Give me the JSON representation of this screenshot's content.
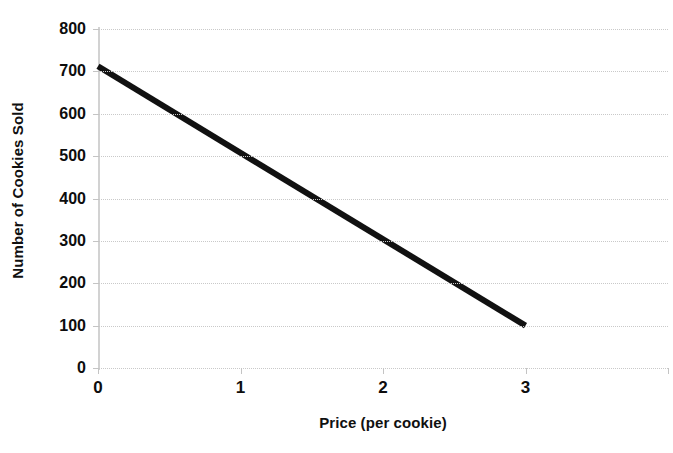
{
  "chart_data": {
    "type": "line",
    "title": "",
    "subtitle": "",
    "xlabel": "Price (per cookie)",
    "ylabel": "Number of Cookies Sold",
    "xlim": [
      0,
      4
    ],
    "ylim": [
      0,
      800
    ],
    "grid": true,
    "grid_axis": "y",
    "legend": "none",
    "line_color": "#111111",
    "gridline_color": "#c9c9c9",
    "axis_color": "#d2d2d2",
    "background_color": "#ffffff",
    "x_ticks": [
      0,
      1,
      2,
      3,
      4
    ],
    "x_tick_labels": [
      "0",
      "1",
      "2",
      "3",
      ""
    ],
    "y_ticks": [
      0,
      100,
      200,
      300,
      400,
      500,
      600,
      700,
      800
    ],
    "y_tick_labels": [
      "0",
      "100",
      "200",
      "300",
      "400",
      "500",
      "600",
      "700",
      "800"
    ],
    "series": [
      {
        "name": "Demand",
        "x": [
          0,
          3
        ],
        "values": [
          712,
          100
        ],
        "points": [
          {
            "x": 0,
            "y": 712
          },
          {
            "x": 3,
            "y": 100
          }
        ]
      }
    ],
    "annotations": []
  }
}
